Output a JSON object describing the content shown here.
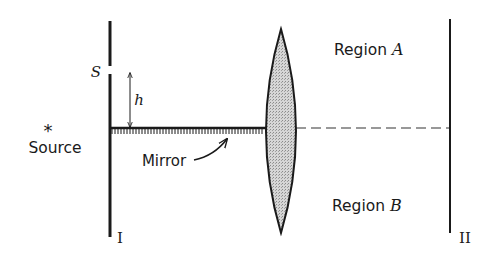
{
  "diagram": {
    "type": "optics-lloyds-mirror",
    "colors": {
      "ink": "#1a1a1a",
      "lens_fill": "#c8c8c8",
      "background": "#ffffff"
    },
    "labels": {
      "source": "Source",
      "source_symbol": "*",
      "slit": "S",
      "height": "h",
      "mirror": "Mirror",
      "region_a_prefix": "Region ",
      "region_a_letter": "A",
      "region_b_prefix": "Region ",
      "region_b_letter": "B",
      "screen_1": "I",
      "screen_2": "II"
    },
    "elements": {
      "screen_1": {
        "x": 110,
        "y_top": 21,
        "y_bottom": 237,
        "slit_gap": [
          66,
          74
        ]
      },
      "screen_2": {
        "x": 450,
        "y_top": 19,
        "y_bottom": 233
      },
      "mirror": {
        "x_start": 110,
        "x_end": 265,
        "y": 128
      },
      "lens": {
        "cx": 281,
        "y_top": 29,
        "y_bottom": 233,
        "x_left": 265,
        "x_right": 297
      },
      "axis_dashed": {
        "x_start": 265,
        "x_end": 450,
        "y": 128
      },
      "height_arrow": {
        "x": 130,
        "y_top": 72,
        "y_bottom": 128
      }
    }
  }
}
